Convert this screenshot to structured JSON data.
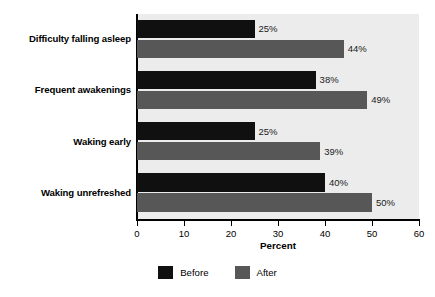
{
  "chart_data": {
    "type": "bar",
    "orientation": "horizontal",
    "title": "",
    "xlabel": "Percent",
    "ylabel": "",
    "xlim": [
      0,
      60
    ],
    "xticks": [
      0,
      10,
      20,
      30,
      40,
      50,
      60
    ],
    "grid": false,
    "legend_position": "bottom-center",
    "categories": [
      "Difficulty falling asleep",
      "Frequent awakenings",
      "Waking early",
      "Waking unrefreshed"
    ],
    "series": [
      {
        "name": "Before",
        "color": "#101010",
        "values": [
          25,
          38,
          25,
          40
        ],
        "labels": [
          "25%",
          "38%",
          "25%",
          "40%"
        ]
      },
      {
        "name": "After",
        "color": "#575757",
        "values": [
          44,
          49,
          39,
          50
        ],
        "labels": [
          "44%",
          "49%",
          "39%",
          "50%"
        ]
      }
    ]
  },
  "legend": {
    "items": [
      {
        "label": "Before",
        "color": "#101010"
      },
      {
        "label": "After",
        "color": "#575757"
      }
    ]
  },
  "colors": {
    "plot_background": "#ececec",
    "page_background": "#ffffff",
    "axis": "#000000",
    "before": "#101010",
    "after": "#575757"
  }
}
